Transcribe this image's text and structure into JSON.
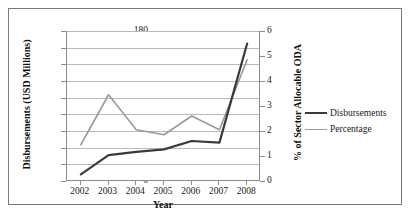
{
  "chart_data": {
    "type": "line",
    "title": "",
    "xlabel": "Year",
    "ylabel": "Disbursements (USD Millions)",
    "y2label": "% of Sector Allocable ODA",
    "categories": [
      "2002",
      "2003",
      "2004",
      "2005",
      "2006",
      "2007",
      "2008"
    ],
    "x": [
      2002,
      2003,
      2004,
      2005,
      2006,
      2007,
      2008
    ],
    "ylim": [
      0,
      180
    ],
    "yticks": [
      0,
      20,
      40,
      60,
      80,
      100,
      120,
      140,
      160,
      180
    ],
    "y2lim": [
      0,
      6
    ],
    "y2ticks": [
      0,
      1,
      2,
      3,
      4,
      5,
      6
    ],
    "grid": true,
    "legend_position": "right",
    "series": [
      {
        "name": "Disbursements",
        "axis": "left",
        "color": "#3a3a3a",
        "width": 2.2,
        "values": [
          8,
          31,
          35,
          38,
          48,
          46,
          165
        ]
      },
      {
        "name": "Percentage",
        "axis": "right",
        "color": "#9a9a9a",
        "width": 1.6,
        "values": [
          1.45,
          3.45,
          2.05,
          1.85,
          2.6,
          2.05,
          4.85
        ]
      }
    ]
  },
  "axes": {
    "left_title": "Disbursements (USD Millions)",
    "right_title": "% of Sector Allocable ODA",
    "x_title": "Year",
    "left_ticks": [
      "0",
      "20",
      "40",
      "60",
      "80",
      "100",
      "120",
      "140",
      "160",
      "180"
    ],
    "right_ticks": [
      "0",
      "1",
      "2",
      "3",
      "4",
      "5",
      "6"
    ],
    "x_ticks": [
      "2002",
      "2003",
      "2004",
      "2005",
      "2006",
      "2007",
      "2008"
    ]
  },
  "legend": {
    "items": [
      {
        "label": "Disbursements",
        "color": "#3a3a3a"
      },
      {
        "label": "Percentage",
        "color": "#9a9a9a"
      }
    ]
  }
}
